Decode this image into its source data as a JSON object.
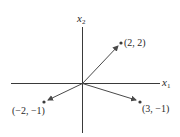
{
  "diagram": {
    "type": "vector-plot",
    "axes": {
      "horizontal": {
        "label": "x",
        "subscript": "1"
      },
      "vertical": {
        "label": "x",
        "subscript": "2"
      }
    },
    "vectors": [
      {
        "from": [
          0,
          0
        ],
        "to": [
          2,
          2
        ],
        "label": "(2, 2)"
      },
      {
        "from": [
          0,
          0
        ],
        "to": [
          3,
          -1
        ],
        "label": "(3, −1)"
      },
      {
        "from": [
          0,
          0
        ],
        "to": [
          -2,
          -1
        ],
        "label": "(−2, −1)"
      }
    ],
    "colors": {
      "axis": "#3a3a3a",
      "vector": "#4a4a4a",
      "point": "#3a3a3a",
      "text": "#2a2a2a"
    }
  }
}
